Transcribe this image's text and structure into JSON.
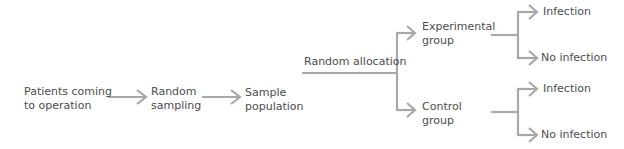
{
  "diagram": {
    "type": "flowchart",
    "line_color": "#a8a8a8",
    "text_color": "#4d4d4d",
    "nodes": {
      "patients": {
        "line1": "Patients coming",
        "line2": "to operation"
      },
      "sampling": {
        "line1": "Random",
        "line2": "sampling"
      },
      "sample_pop": {
        "line1": "Sample",
        "line2": "population"
      },
      "allocation": {
        "label": "Random allocation"
      },
      "experimental": {
        "line1": "Experimental",
        "line2": "group"
      },
      "control": {
        "line1": "Control",
        "line2": "group"
      },
      "exp_infection": {
        "label": "Infection"
      },
      "exp_no_infection": {
        "label": "No infection"
      },
      "ctrl_infection": {
        "label": "Infection"
      },
      "ctrl_no_infection": {
        "label": "No infection"
      }
    },
    "edges": [
      [
        "Patients coming to operation",
        "Random sampling"
      ],
      [
        "Random sampling",
        "Sample population"
      ],
      [
        "Sample population",
        "Experimental group"
      ],
      [
        "Sample population",
        "Control group"
      ],
      [
        "Experimental group",
        "Infection"
      ],
      [
        "Experimental group",
        "No infection"
      ],
      [
        "Control group",
        "Infection"
      ],
      [
        "Control group",
        "No infection"
      ]
    ]
  }
}
